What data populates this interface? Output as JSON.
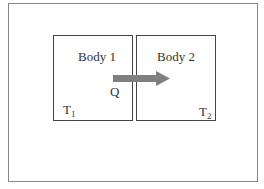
{
  "diagram": {
    "bodies": [
      {
        "label": "Body 1",
        "temp_main": "T",
        "temp_sub": "1"
      },
      {
        "label": "Body 2",
        "temp_main": "T",
        "temp_sub": "2"
      }
    ],
    "heat_flow": {
      "label": "Q",
      "direction": "Body 1 to Body 2",
      "color": "#808080"
    }
  }
}
